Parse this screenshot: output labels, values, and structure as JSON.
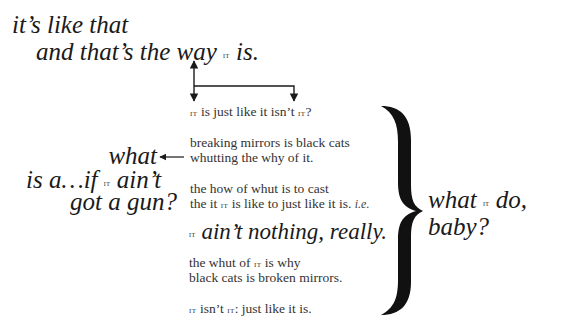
{
  "poem": {
    "heading": {
      "line1": "it’s like that",
      "line2_pre": "and that’s the way",
      "line2_it": "IT",
      "line2_post": "is."
    },
    "center": {
      "q1_it1": "IT",
      "q1_text": "is just like it isn’t",
      "q1_it2": "IT",
      "q1_end": "?",
      "s2_line1": "breaking mirrors is black cats",
      "s2_line2": "whutting the why of it.",
      "s3_line1": "the how of whut is to cast",
      "s3_line2_pre": "the it",
      "s3_line2_it": "IT",
      "s3_line2_post": "is like to just like it is.",
      "s3_line2_ie": "i.e.",
      "big_it": "IT",
      "big_text": "ain’t nothing, really.",
      "s5_line1_pre": "the whut of",
      "s5_line1_it": "IT",
      "s5_line1_post": "is why",
      "s5_line2": "black cats is broken mirrors.",
      "last_it1": "IT",
      "last_mid": "isn’t",
      "last_it2": "IT",
      "last_post": ": just like it is."
    },
    "left": {
      "what": "what",
      "line2_pre": "is a…if",
      "line2_it": "IT",
      "line2_post": "ain’t",
      "line3": "got a gun?"
    },
    "right": {
      "line1_pre": "what",
      "line1_it": "IT",
      "line1_post": "do,",
      "line2": "baby?"
    },
    "icons": [
      "double-arrow-vertical",
      "bracket-arrow",
      "left-arrow",
      "right-curly-brace"
    ]
  }
}
